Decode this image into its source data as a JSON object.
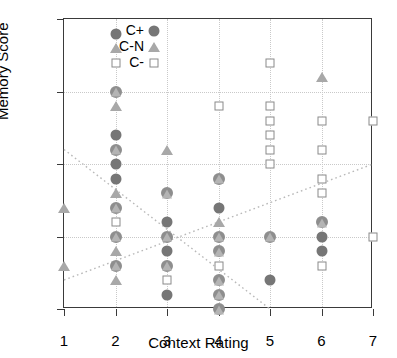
{
  "chart_data": {
    "type": "scatter",
    "title": "",
    "xlabel": "Context Rating",
    "ylabel": "Memory Score",
    "xlim": [
      1,
      7
    ],
    "ylim": [
      0,
      20
    ],
    "xticks": [
      1,
      2,
      3,
      4,
      5,
      6,
      7
    ],
    "yticks": [
      0,
      5,
      10,
      15,
      20
    ],
    "grid": true,
    "legend_position": "top-left",
    "legend": [
      "C+",
      "C-N",
      "C-"
    ],
    "series": [
      {
        "name": "C+",
        "marker": "filled-circle",
        "color": "#767676",
        "points": [
          [
            2,
            19
          ],
          [
            2,
            12
          ],
          [
            2,
            10
          ],
          [
            2,
            9
          ],
          [
            3,
            6
          ],
          [
            3,
            4
          ],
          [
            3,
            1
          ],
          [
            4,
            7
          ],
          [
            5,
            2
          ],
          [
            6,
            5
          ],
          [
            6,
            4
          ]
        ]
      },
      {
        "name": "C-N",
        "marker": "triangle",
        "color": "#a8a8a8",
        "points": [
          [
            1,
            7
          ],
          [
            1,
            3
          ],
          [
            2,
            18
          ],
          [
            2,
            14
          ],
          [
            2,
            8
          ],
          [
            2,
            4
          ],
          [
            2,
            2
          ],
          [
            3,
            11
          ],
          [
            4,
            6
          ],
          [
            6,
            16
          ]
        ]
      },
      {
        "name": "C-",
        "marker": "open-square",
        "color": "#8a8a8a",
        "points": [
          [
            2,
            17
          ],
          [
            2,
            6
          ],
          [
            3,
            2
          ],
          [
            4,
            14
          ],
          [
            4,
            3
          ],
          [
            5,
            17
          ],
          [
            5,
            14
          ],
          [
            5,
            13
          ],
          [
            5,
            12
          ],
          [
            5,
            11
          ],
          [
            5,
            10
          ],
          [
            6,
            13
          ],
          [
            6,
            11
          ],
          [
            6,
            9
          ],
          [
            6,
            8
          ],
          [
            6,
            3
          ],
          [
            7,
            13
          ],
          [
            7,
            5
          ]
        ]
      },
      {
        "name": "C+ / C-N overlap",
        "marker": "circle-with-triangle",
        "color": "#8e8e8e",
        "points": [
          [
            2,
            15
          ],
          [
            2,
            11
          ],
          [
            2,
            7
          ],
          [
            2,
            5
          ],
          [
            2,
            3
          ],
          [
            3,
            8
          ],
          [
            3,
            5
          ],
          [
            3,
            3
          ],
          [
            4,
            9
          ],
          [
            4,
            5
          ],
          [
            4,
            4
          ],
          [
            4,
            2
          ],
          [
            4,
            1
          ],
          [
            4,
            0
          ],
          [
            5,
            5
          ],
          [
            6,
            6
          ]
        ]
      }
    ],
    "trendlines": [
      {
        "name": "descending-trend",
        "style": "dotted",
        "color": "#b9b9b9",
        "x": [
          1,
          5
        ],
        "y": [
          11,
          0
        ]
      },
      {
        "name": "ascending-trend",
        "style": "dotted",
        "color": "#b9b9b9",
        "x": [
          1,
          7
        ],
        "y": [
          2,
          10
        ]
      }
    ]
  }
}
